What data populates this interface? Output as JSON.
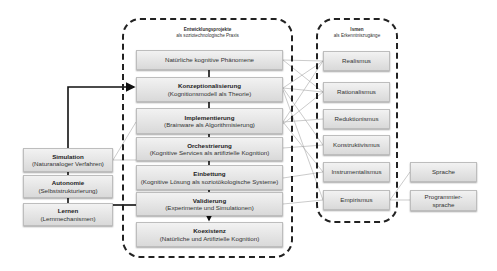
{
  "central": {
    "title": "Entwicklungsprojekte",
    "subtitle": "als soziotechnologische Praxis",
    "boxes": [
      {
        "title": "",
        "subtitle": "Natürliche kognitive Phänomene"
      },
      {
        "title": "Konzeptionalisierung",
        "subtitle": "(Kognitionsmodell als Theorie)"
      },
      {
        "title": "Implementierung",
        "subtitle": "(Brainware als Algorithmisierung)"
      },
      {
        "title": "Orchestrierung",
        "subtitle": "(Kognitive Services als artifizielle Kognition)"
      },
      {
        "title": "Einbettung",
        "subtitle": "(Kognitive Lösung als soziotökologische Systeme)"
      },
      {
        "title": "Validierung",
        "subtitle": "(Experimente und Simulationen)"
      },
      {
        "title": "Koexistenz",
        "subtitle": "(Natürliche  und Artifizielle  Kognition)"
      }
    ]
  },
  "isms": {
    "title": "Ismen",
    "subtitle": "als Erkenntniszugänge",
    "boxes": [
      {
        "label": "Realismus"
      },
      {
        "label": "Rationalismus"
      },
      {
        "label": "Reduktionismus"
      },
      {
        "label": "Konstruktivismus"
      },
      {
        "label": "Instrumentalismus"
      },
      {
        "label": "Empirismus"
      }
    ]
  },
  "languages": {
    "boxes": [
      {
        "label": "Sprache"
      },
      {
        "label": "Programmier-\nsprache"
      }
    ]
  },
  "left": {
    "boxes": [
      {
        "title": "Simulation",
        "subtitle": "(Naturanaloger Verfahren)"
      },
      {
        "title": "Autonomie",
        "subtitle": "(Selbststrukturierung)"
      },
      {
        "title": "Lernen",
        "subtitle": "(Lernmechanismen)"
      }
    ]
  },
  "colors": {
    "box_top": "#f2f2f2",
    "box_bottom": "#d9d9d9",
    "border": "#222222",
    "connector": "#9a9a9a"
  }
}
